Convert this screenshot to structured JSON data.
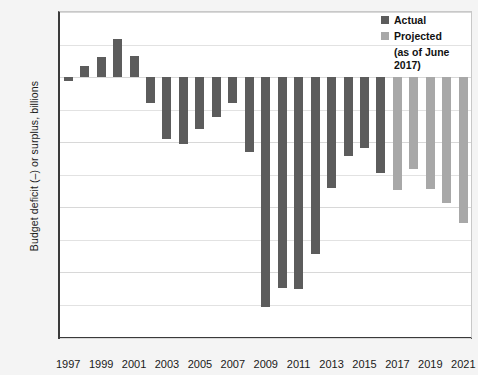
{
  "chart_data": {
    "type": "bar",
    "title": "",
    "xlabel": "",
    "ylabel": "Budget deficit (–) or surplus, billions",
    "ylim": [
      -1600,
      400
    ],
    "ytick_labels": [
      "$400",
      "0",
      "–400",
      "–800",
      "–1,200",
      "–1,600"
    ],
    "ytick_values": [
      400,
      0,
      -400,
      -800,
      -1200,
      -1600
    ],
    "minor_gridlines": [
      200,
      -200,
      -600,
      -1000,
      -1400
    ],
    "grid": true,
    "xtick_labels": [
      "1997",
      "1999",
      "2001",
      "2003",
      "2005",
      "2007",
      "2009",
      "2011",
      "2013",
      "2015",
      "2017",
      "2019",
      "2021"
    ],
    "xtick_values": [
      1997,
      1999,
      2001,
      2003,
      2005,
      2007,
      2009,
      2011,
      2013,
      2015,
      2017,
      2019,
      2021
    ],
    "categories": [
      1997,
      1998,
      1999,
      2000,
      2001,
      2002,
      2003,
      2004,
      2005,
      2006,
      2007,
      2008,
      2009,
      2010,
      2011,
      2012,
      2013,
      2014,
      2015,
      2016,
      2017,
      2018,
      2019,
      2020,
      2021
    ],
    "values": [
      -22,
      69,
      126,
      236,
      128,
      -158,
      -378,
      -413,
      -318,
      -248,
      -161,
      -459,
      -1413,
      -1294,
      -1300,
      -1087,
      -679,
      -485,
      -438,
      -587,
      -693,
      -563,
      -689,
      -775,
      -897
    ],
    "series": [
      {
        "name": "Actual",
        "color": "#5c5c5c",
        "points": [
          {
            "year": 1997,
            "value": -22
          },
          {
            "year": 1998,
            "value": 69
          },
          {
            "year": 1999,
            "value": 126
          },
          {
            "year": 2000,
            "value": 236
          },
          {
            "year": 2001,
            "value": 128
          },
          {
            "year": 2002,
            "value": -158
          },
          {
            "year": 2003,
            "value": -378
          },
          {
            "year": 2004,
            "value": -413
          },
          {
            "year": 2005,
            "value": -318
          },
          {
            "year": 2006,
            "value": -248
          },
          {
            "year": 2007,
            "value": -161
          },
          {
            "year": 2008,
            "value": -459
          },
          {
            "year": 2009,
            "value": -1413
          },
          {
            "year": 2010,
            "value": -1294
          },
          {
            "year": 2011,
            "value": -1300
          },
          {
            "year": 2012,
            "value": -1087
          },
          {
            "year": 2013,
            "value": -679
          },
          {
            "year": 2014,
            "value": -485
          },
          {
            "year": 2015,
            "value": -438
          },
          {
            "year": 2016,
            "value": -587
          }
        ]
      },
      {
        "name": "Projected",
        "color": "#a8a8a8",
        "points": [
          {
            "year": 2017,
            "value": -693
          },
          {
            "year": 2018,
            "value": -563
          },
          {
            "year": 2019,
            "value": -689
          },
          {
            "year": 2020,
            "value": -775
          },
          {
            "year": 2021,
            "value": -897
          }
        ]
      }
    ],
    "legend": {
      "position": "top-right",
      "entries": [
        {
          "label": "Actual",
          "color": "#5c5c5c"
        },
        {
          "label": "Projected",
          "color": "#a8a8a8",
          "sublabel": "(as of June 2017)"
        }
      ]
    }
  },
  "legend": {
    "actual_label": "Actual",
    "projected_label": "Projected",
    "projected_sublabel": "(as of June 2017)"
  },
  "axis": {
    "y_title": "Budget deficit (–) or surplus, billions"
  }
}
